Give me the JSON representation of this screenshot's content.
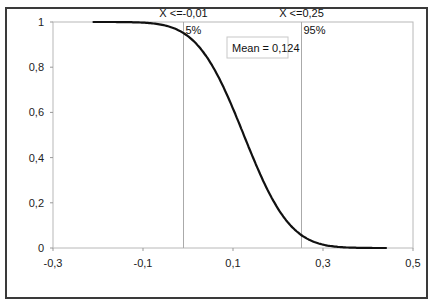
{
  "chart_data": {
    "type": "line",
    "title": "",
    "xlabel": "",
    "ylabel": "",
    "xlim": [
      -0.3,
      0.5
    ],
    "ylim": [
      0,
      1
    ],
    "grid": false,
    "legend": null,
    "x_ticks": [
      "-0,3",
      "-0,1",
      "0,1",
      "0,3",
      "0,5"
    ],
    "x_tick_values": [
      -0.3,
      -0.1,
      0.1,
      0.3,
      0.5
    ],
    "y_ticks": [
      "0",
      "0,2",
      "0,4",
      "0,6",
      "0,8",
      "1"
    ],
    "y_tick_values": [
      0,
      0.2,
      0.4,
      0.6,
      0.8,
      1.0
    ],
    "series": [
      {
        "name": "Descending cumulative",
        "color": "#111111",
        "x": [
          -0.21,
          -0.15,
          -0.1,
          -0.05,
          -0.01,
          0.02,
          0.05,
          0.08,
          0.1,
          0.124,
          0.15,
          0.18,
          0.21,
          0.25,
          0.28,
          0.32,
          0.36,
          0.4,
          0.44
        ],
        "y": [
          1.0,
          0.999,
          0.997,
          0.985,
          0.95,
          0.9,
          0.82,
          0.7,
          0.61,
          0.5,
          0.38,
          0.25,
          0.15,
          0.06,
          0.03,
          0.008,
          0.002,
          0.0005,
          0.0
        ]
      }
    ],
    "markers": [
      {
        "x": -0.01,
        "label": "X <=-0,01",
        "percent": "5%"
      },
      {
        "x": 0.25,
        "label": "X <=0,25",
        "percent": "95%"
      }
    ],
    "annotations": [
      {
        "text": "Mean = 0,124",
        "value": 0.124
      }
    ]
  }
}
